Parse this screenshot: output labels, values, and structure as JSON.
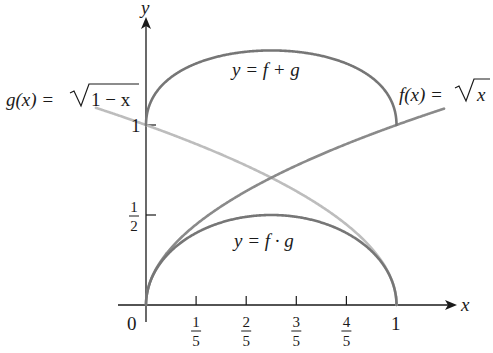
{
  "chart_data": {
    "type": "line",
    "title": "",
    "xlabel": "x",
    "ylabel": "y",
    "xlim": [
      -0.2,
      1.2
    ],
    "ylim": [
      0,
      1.55
    ],
    "grid": false,
    "legend": "none (curves labeled inline)",
    "x_ticks": [
      {
        "value": 0,
        "label": "0"
      },
      {
        "value": 0.2,
        "num": "1",
        "den": "5"
      },
      {
        "value": 0.4,
        "num": "2",
        "den": "5"
      },
      {
        "value": 0.6,
        "num": "3",
        "den": "5"
      },
      {
        "value": 0.8,
        "num": "4",
        "den": "5"
      },
      {
        "value": 1,
        "label": "1"
      }
    ],
    "y_ticks": [
      {
        "value": 0.5,
        "num": "1",
        "den": "2"
      },
      {
        "value": 1,
        "label": "1"
      }
    ],
    "series": [
      {
        "name": "f(x) = √x",
        "expr": "sqrt(x)",
        "domain": [
          0,
          1.19
        ],
        "color": "#8a8a8a",
        "sample": {
          "x": [
            0,
            0.2,
            0.4,
            0.6,
            0.8,
            1.0,
            1.19
          ],
          "y": [
            0,
            0.447,
            0.632,
            0.775,
            0.894,
            1.0,
            1.091
          ]
        }
      },
      {
        "name": "g(x) = √(1 − x)",
        "expr": "sqrt(1-x)",
        "domain": [
          -0.2,
          1
        ],
        "color": "#bdbdbd",
        "sample": {
          "x": [
            -0.2,
            0,
            0.2,
            0.4,
            0.6,
            0.8,
            1.0
          ],
          "y": [
            1.095,
            1.0,
            0.894,
            0.775,
            0.632,
            0.447,
            0
          ]
        }
      },
      {
        "name": "y = f + g",
        "expr": "sqrt(x)+sqrt(1-x)",
        "domain": [
          0,
          1
        ],
        "color": "#767676",
        "sample": {
          "x": [
            0,
            0.2,
            0.4,
            0.5,
            0.6,
            0.8,
            1.0
          ],
          "y": [
            1.0,
            1.341,
            1.407,
            1.414,
            1.407,
            1.341,
            1.0
          ]
        }
      },
      {
        "name": "y = f · g",
        "expr": "sqrt(x)*sqrt(1-x)",
        "domain": [
          0,
          1
        ],
        "color": "#767676",
        "sample": {
          "x": [
            0,
            0.2,
            0.4,
            0.5,
            0.6,
            0.8,
            1.0
          ],
          "y": [
            0,
            0.4,
            0.49,
            0.5,
            0.49,
            0.4,
            0
          ]
        }
      }
    ],
    "annotations": [
      {
        "text": "g(x) = √1 − x",
        "target": "g"
      },
      {
        "text": "f(x) = √x",
        "target": "f"
      },
      {
        "text": "y = f + g",
        "target": "f+g"
      },
      {
        "text": "y = f · g",
        "target": "f·g"
      }
    ]
  },
  "labels": {
    "axis_x": "x",
    "axis_y": "y",
    "origin": "0",
    "x_one": "1",
    "y_one": "1",
    "g_label_lhs": "g(x) = ",
    "g_label_rad": "1 − x",
    "f_label_lhs": "f(x) = ",
    "f_label_rad": "x",
    "sum_label": "y = f + g",
    "prod_label": "y = f · g"
  }
}
